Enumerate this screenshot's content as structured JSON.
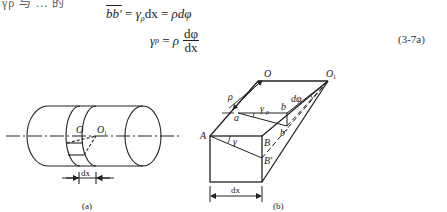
{
  "top_cut_text": "γρ 与 ... 的",
  "equations": {
    "eq1": {
      "lhs": "bb′",
      "mid_gamma": "γ",
      "mid_sub": "ρ",
      "mid_dx": "dx",
      "rhs": "ρdφ",
      "eq_sign": "="
    },
    "eq2": {
      "lhs_gamma": "γ",
      "lhs_sub": "ρ",
      "eq_sign": "=",
      "rho": "ρ",
      "numerator": "dφ",
      "denominator": "dx"
    },
    "number": "(3-7a)"
  },
  "figure_a": {
    "caption": "(a)",
    "labels": {
      "O": "O",
      "O1": "O",
      "O1_sub": "1",
      "dx": "dx"
    }
  },
  "figure_b": {
    "caption": "(b)",
    "labels": {
      "O": "O",
      "O1": "O",
      "O1_sub": "1",
      "rho": "ρ",
      "gamma_rho": "γ",
      "gamma_rho_sub": "ρ",
      "a": "a",
      "b": "b",
      "b_prime": "b′",
      "dphi": "dφ",
      "A": "A",
      "B": "B",
      "B_prime": "B′",
      "gamma": "γ",
      "dx": "dx"
    }
  }
}
